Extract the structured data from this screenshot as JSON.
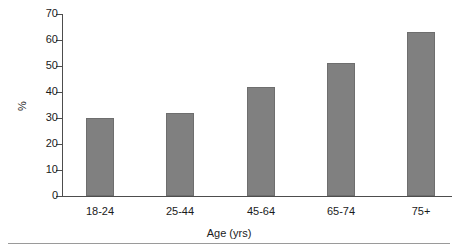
{
  "chart_data": {
    "type": "bar",
    "title": "",
    "subtitle": "",
    "xlabel": "Age (yrs)",
    "ylabel": "%",
    "categories": [
      "18-24",
      "25-44",
      "45-64",
      "65-74",
      "75+"
    ],
    "values": [
      30,
      32,
      42,
      51,
      63
    ],
    "series": [
      {
        "name": "",
        "values": [
          30,
          32,
          42,
          51,
          63
        ]
      }
    ],
    "ylim": [
      0,
      70
    ],
    "yticks": [
      0,
      10,
      20,
      30,
      40,
      50,
      60,
      70
    ],
    "ytick_labels": [
      "0",
      "10",
      "20",
      "30",
      "40",
      "50",
      "60",
      "70"
    ],
    "grid": false,
    "legend": false,
    "legend_position": "none",
    "bar_color": "#808080",
    "bar_edge_color": "#6e6e6e",
    "axis_color": "#4d4d4d",
    "background_color": "#ffffff",
    "annotations": []
  }
}
